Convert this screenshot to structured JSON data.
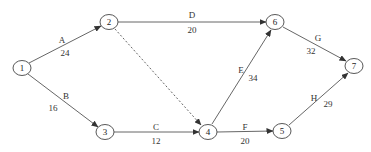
{
  "diagram": {
    "type": "activity-on-arrow network",
    "colors": {
      "line": "#444444",
      "text": "#333333",
      "background": "#ffffff"
    },
    "nodes": [
      {
        "id": "1",
        "label": "1",
        "x": 22,
        "y": 68
      },
      {
        "id": "2",
        "label": "2",
        "x": 109,
        "y": 22
      },
      {
        "id": "3",
        "label": "3",
        "x": 105,
        "y": 132
      },
      {
        "id": "4",
        "label": "4",
        "x": 208,
        "y": 132
      },
      {
        "id": "5",
        "label": "5",
        "x": 282,
        "y": 131
      },
      {
        "id": "6",
        "label": "6",
        "x": 275,
        "y": 22
      },
      {
        "id": "7",
        "label": "7",
        "x": 354,
        "y": 66
      }
    ],
    "edges": [
      {
        "from": "1",
        "to": "2",
        "activity": "A",
        "duration": "24",
        "dashed": false
      },
      {
        "from": "1",
        "to": "3",
        "activity": "B",
        "duration": "16",
        "dashed": false
      },
      {
        "from": "3",
        "to": "4",
        "activity": "C",
        "duration": "12",
        "dashed": false
      },
      {
        "from": "2",
        "to": "6",
        "activity": "D",
        "duration": "20",
        "dashed": false
      },
      {
        "from": "4",
        "to": "6",
        "activity": "E",
        "duration": "34",
        "dashed": false
      },
      {
        "from": "4",
        "to": "5",
        "activity": "F",
        "duration": "20",
        "dashed": false
      },
      {
        "from": "6",
        "to": "7",
        "activity": "G",
        "duration": "32",
        "dashed": false
      },
      {
        "from": "5",
        "to": "7",
        "activity": "H",
        "duration": "29",
        "dashed": false
      },
      {
        "from": "2",
        "to": "4",
        "activity": "",
        "duration": "",
        "dashed": true
      }
    ]
  },
  "labels": {
    "nodes": {
      "n1": "1",
      "n2": "2",
      "n3": "3",
      "n4": "4",
      "n5": "5",
      "n6": "6",
      "n7": "7"
    },
    "edges": {
      "A": {
        "name": "A",
        "value": "24"
      },
      "B": {
        "name": "B",
        "value": "16"
      },
      "C": {
        "name": "C",
        "value": "12"
      },
      "D": {
        "name": "D",
        "value": "20"
      },
      "E": {
        "name": "E",
        "value": "34"
      },
      "F": {
        "name": "F",
        "value": "20"
      },
      "G": {
        "name": "G",
        "value": "32"
      },
      "H": {
        "name": "H",
        "value": "29"
      }
    }
  }
}
